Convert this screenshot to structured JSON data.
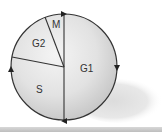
{
  "diagram": {
    "type": "cell-cycle-pie",
    "phases": [
      {
        "label": "G1",
        "start_angle_deg": 0,
        "end_angle_deg": 180
      },
      {
        "label": "S",
        "start_angle_deg": 180,
        "end_angle_deg": 281
      },
      {
        "label": "G2",
        "start_angle_deg": 281,
        "end_angle_deg": 339
      },
      {
        "label": "M",
        "start_angle_deg": 339,
        "end_angle_deg": 360
      }
    ],
    "direction": "clockwise",
    "colors": {
      "outline": "#333333",
      "fill_light": "#f2f2f2",
      "fill_dark": "#c9c9c9",
      "shadow": "#e4e4e4"
    }
  }
}
